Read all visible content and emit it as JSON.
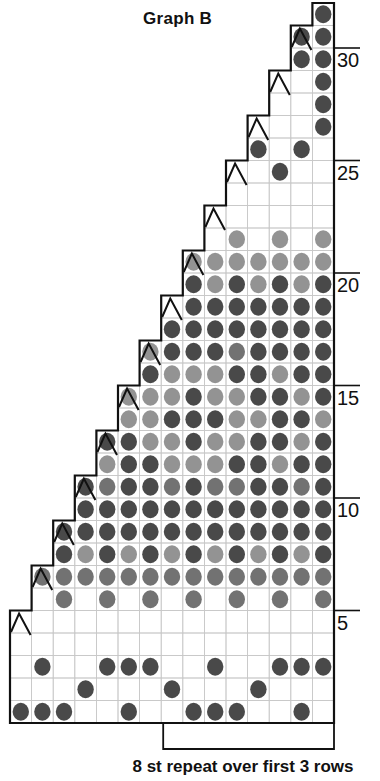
{
  "title": "Graph B",
  "footer": "8 st repeat over first 3 rows",
  "row_labels": [
    {
      "row": 5,
      "text": "5"
    },
    {
      "row": 10,
      "text": "10"
    },
    {
      "row": 15,
      "text": "15"
    },
    {
      "row": 20,
      "text": "20"
    },
    {
      "row": 25,
      "text": "25"
    },
    {
      "row": 30,
      "text": "30"
    }
  ],
  "colors": {
    "grid_line": "#c8c8c8",
    "outline": "#111111",
    "dot_dark": "#3a3a3a",
    "dot_medium": "#666666",
    "dot_light": "#8a8a8a"
  },
  "legend": {
    "dot": "contrast-colour stitch",
    "caret": "decrease"
  },
  "chart_data": {
    "type": "table",
    "title": "Graph B",
    "columns": 15,
    "rows_total": 32,
    "encoding": "row strings listed bottom (row 1) to top (row 32); '.'=outside chart, '0'=empty square, 'D'=dark dot, 'M'=medium dot, 'L'=light dot",
    "repeat_note": "8 st repeat over first 3 rows",
    "repeat_bracket_cols": [
      8,
      15
    ],
    "rows": [
      {
        "row": 1,
        "cells": "DDD00D00DDD00D0",
        "decrease_col": null
      },
      {
        "row": 2,
        "cells": "000D000D000D000",
        "decrease_col": null
      },
      {
        "row": 3,
        "cells": "0D00DDD00D00DDD",
        "decrease_col": null
      },
      {
        "row": 4,
        "cells": "000000000000000",
        "decrease_col": null
      },
      {
        "row": 5,
        "cells": "000000000000000",
        "decrease_col": 1
      },
      {
        "row": 6,
        "cells": ".0M0M0M0M0M0M0M",
        "decrease_col": null
      },
      {
        "row": 7,
        "cells": ".MMMMMMMMMMMMMM",
        "decrease_col": 2
      },
      {
        "row": 8,
        "cells": "..DLDLDLDLDLDLD",
        "decrease_col": null
      },
      {
        "row": 9,
        "cells": "..DDDDDDDDDDDDD",
        "decrease_col": 3
      },
      {
        "row": 10,
        "cells": "...DDDDDDDDDDDD",
        "decrease_col": null
      },
      {
        "row": 11,
        "cells": "...DMDDMDMMDDMDM",
        "decrease_col": 4
      },
      {
        "row": 12,
        "cells": "....LDDLLLDDLDD",
        "decrease_col": null
      },
      {
        "row": 13,
        "cells": "....DDLLDLLDDLD",
        "decrease_col": 5
      },
      {
        "row": 14,
        "cells": ".....LLDDDLLDDL",
        "decrease_col": null
      },
      {
        "row": 15,
        "cells": ".....LLLDLLDDLD",
        "decrease_col": 6
      },
      {
        "row": 16,
        "cells": "......DLLLDDLDD",
        "decrease_col": null
      },
      {
        "row": 17,
        "cells": "......LDDDMDDDD",
        "decrease_col": 7
      },
      {
        "row": 18,
        "cells": ".......DDDDDDDD",
        "decrease_col": null
      },
      {
        "row": 19,
        "cells": ".......0DDDDDDD",
        "decrease_col": 8
      },
      {
        "row": 20,
        "cells": "........DLDLDLD",
        "decrease_col": null
      },
      {
        "row": 21,
        "cells": "........LLLLLLL",
        "decrease_col": 9
      },
      {
        "row": 22,
        "cells": ".........0L0L0L",
        "decrease_col": null
      },
      {
        "row": 23,
        "cells": ".........000000",
        "decrease_col": 10
      },
      {
        "row": 24,
        "cells": "..........00000",
        "decrease_col": null
      },
      {
        "row": 25,
        "cells": "..........00D00",
        "decrease_col": 11
      },
      {
        "row": 26,
        "cells": "...........D0D0",
        "decrease_col": null
      },
      {
        "row": 27,
        "cells": "...........000D",
        "decrease_col": 12
      },
      {
        "row": 28,
        "cells": "............00D",
        "decrease_col": null
      },
      {
        "row": 29,
        "cells": "............00D",
        "decrease_col": 13
      },
      {
        "row": 30,
        "cells": ".............DD",
        "decrease_col": null
      },
      {
        "row": 31,
        "cells": ".............DD",
        "decrease_col": 14
      },
      {
        "row": 32,
        "cells": "..............D",
        "decrease_col": null
      }
    ]
  }
}
